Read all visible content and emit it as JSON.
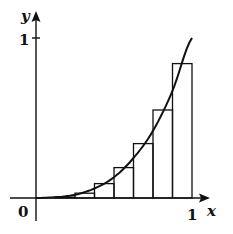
{
  "chart_data": {
    "type": "bar",
    "title": "",
    "xlabel": "x",
    "ylabel": "y",
    "xlim": [
      0,
      1
    ],
    "ylim": [
      0,
      1
    ],
    "x_ticks": [
      "0",
      "1"
    ],
    "y_ticks": [
      "1"
    ],
    "origin_label": "0",
    "grid": false,
    "legend": null,
    "rectangles": [
      {
        "x0": 0.0,
        "x1": 0.125,
        "height": 0.0
      },
      {
        "x0": 0.125,
        "x1": 0.25,
        "height": 0.005
      },
      {
        "x0": 0.25,
        "x1": 0.375,
        "height": 0.03
      },
      {
        "x0": 0.375,
        "x1": 0.5,
        "height": 0.09
      },
      {
        "x0": 0.5,
        "x1": 0.625,
        "height": 0.19
      },
      {
        "x0": 0.625,
        "x1": 0.75,
        "height": 0.34
      },
      {
        "x0": 0.75,
        "x1": 0.875,
        "height": 0.55
      },
      {
        "x0": 0.875,
        "x1": 1.0,
        "height": 0.84
      }
    ],
    "curve": {
      "x": [
        0,
        0.125,
        0.25,
        0.375,
        0.5,
        0.625,
        0.75,
        0.875,
        1.0
      ],
      "y": [
        0,
        0.005,
        0.02,
        0.06,
        0.13,
        0.25,
        0.42,
        0.67,
        1.0
      ]
    }
  },
  "labels": {
    "x_axis": "x",
    "y_axis": "y",
    "origin": "0",
    "x_one": "1",
    "y_one": "1"
  }
}
